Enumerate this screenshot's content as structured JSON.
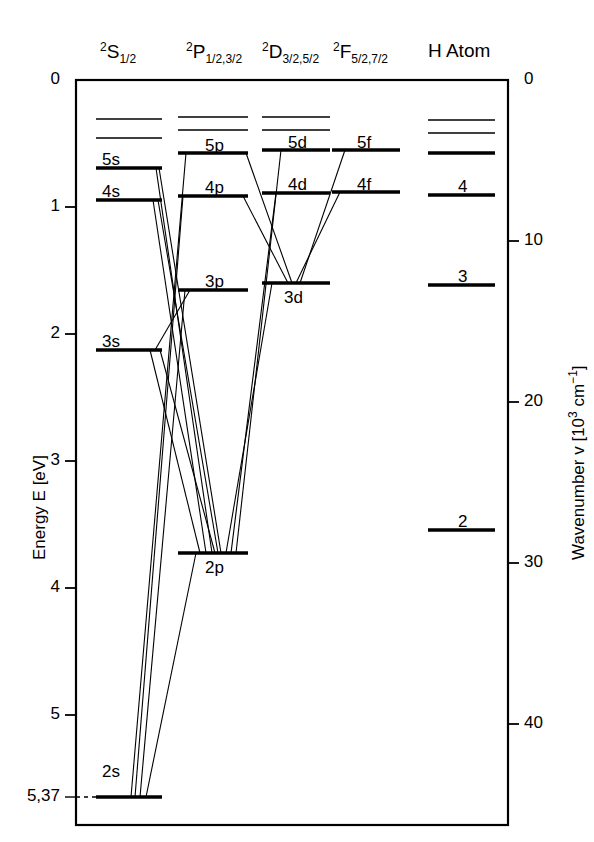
{
  "figure": {
    "kind": "grotrian-energy-level-diagram",
    "frame": {
      "x0": 76,
      "y0": 80,
      "x1": 508,
      "y1": 825
    }
  },
  "column_headers": [
    {
      "name": "header-s",
      "term": "S",
      "multiplicity": "2",
      "j": "1/2",
      "x": 100,
      "y": 40
    },
    {
      "name": "header-p",
      "term": "P",
      "multiplicity": "2",
      "j": "1/2,3/2",
      "x": 186,
      "y": 40
    },
    {
      "name": "header-d",
      "term": "D",
      "multiplicity": "2",
      "j": "3/2,5/2",
      "x": 262,
      "y": 40
    },
    {
      "name": "header-f",
      "term": "F",
      "multiplicity": "2",
      "j": "5/2,7/2",
      "x": 333,
      "y": 40
    },
    {
      "name": "header-h",
      "text": "H Atom",
      "x": 428,
      "y": 40
    }
  ],
  "left_axis": {
    "title": "Energy E [eV]",
    "title_x": 30,
    "title_y": 560,
    "unit": "eV",
    "ticks": [
      {
        "label": "0",
        "value": 0,
        "y": 80
      },
      {
        "label": "1",
        "value": 1,
        "y": 207
      },
      {
        "label": "2",
        "value": 2,
        "y": 334
      },
      {
        "label": "3",
        "value": 3,
        "y": 461
      },
      {
        "label": "4",
        "value": 4,
        "y": 588
      },
      {
        "label": "5",
        "value": 5,
        "y": 715
      },
      {
        "label": "5,37",
        "value": 5.37,
        "y": 797,
        "dashed": true
      }
    ]
  },
  "right_axis": {
    "title": "Wavenumber v [10³ cm⁻¹]",
    "title_x": 566,
    "title_y": 560,
    "unit": "10^3 cm^-1",
    "ticks": [
      {
        "label": "0",
        "value": 0,
        "y": 80
      },
      {
        "label": "10",
        "value": 10,
        "y": 241
      },
      {
        "label": "20",
        "value": 20,
        "y": 402
      },
      {
        "label": "30",
        "value": 30,
        "y": 563
      },
      {
        "label": "40",
        "value": 40,
        "y": 724
      }
    ]
  },
  "columns": [
    {
      "name": "column-s",
      "x0": 96,
      "x1": 162
    },
    {
      "name": "column-p",
      "x0": 178,
      "x1": 248
    },
    {
      "name": "column-d",
      "x0": 262,
      "x1": 330
    },
    {
      "name": "column-f",
      "x0": 332,
      "x1": 400
    },
    {
      "name": "column-h",
      "x0": 428,
      "x1": 495
    }
  ],
  "levels": [
    {
      "name": "level-s-6",
      "column": "s",
      "label": "",
      "y": 119,
      "x0": 96,
      "x1": 162,
      "thin": true
    },
    {
      "name": "level-s-5b",
      "column": "s",
      "label": "",
      "y": 138,
      "x0": 96,
      "x1": 162,
      "thin": true
    },
    {
      "name": "level-5s",
      "column": "s",
      "label": "5s",
      "y": 168,
      "x0": 96,
      "x1": 162,
      "label_x": 102,
      "label_y": 150
    },
    {
      "name": "level-4s",
      "column": "s",
      "label": "4s",
      "y": 200,
      "x0": 96,
      "x1": 162,
      "label_x": 102,
      "label_y": 182
    },
    {
      "name": "level-p-6",
      "column": "p",
      "label": "",
      "y": 117,
      "x0": 178,
      "x1": 248,
      "thin": true
    },
    {
      "name": "level-p-7",
      "column": "p",
      "label": "",
      "y": 130,
      "x0": 178,
      "x1": 248,
      "thin": true
    },
    {
      "name": "level-5p",
      "column": "p",
      "label": "5p",
      "y": 153,
      "x0": 178,
      "x1": 248,
      "label_x": 205,
      "label_y": 136
    },
    {
      "name": "level-4p",
      "column": "p",
      "label": "4p",
      "y": 196,
      "x0": 178,
      "x1": 248,
      "label_x": 205,
      "label_y": 178
    },
    {
      "name": "level-d-6",
      "column": "d",
      "label": "",
      "y": 117,
      "x0": 262,
      "x1": 330,
      "thin": true
    },
    {
      "name": "level-d-7",
      "column": "d",
      "label": "",
      "y": 130,
      "x0": 262,
      "x1": 330,
      "thin": true
    },
    {
      "name": "level-5d",
      "column": "d",
      "label": "5d",
      "y": 150,
      "x0": 262,
      "x1": 330,
      "label_x": 288,
      "label_y": 133
    },
    {
      "name": "level-4d",
      "column": "d",
      "label": "4d",
      "y": 193,
      "x0": 262,
      "x1": 330,
      "label_x": 288,
      "label_y": 175
    },
    {
      "name": "level-5f",
      "column": "f",
      "label": "5f",
      "y": 150,
      "x0": 332,
      "x1": 400,
      "label_x": 357,
      "label_y": 133
    },
    {
      "name": "level-4f",
      "column": "f",
      "label": "4f",
      "y": 192,
      "x0": 332,
      "x1": 400,
      "label_x": 357,
      "label_y": 175
    },
    {
      "name": "level-3p",
      "column": "p",
      "label": "3p",
      "y": 290,
      "x0": 178,
      "x1": 248,
      "label_x": 205,
      "label_y": 272
    },
    {
      "name": "level-3d",
      "column": "d",
      "label": "3d",
      "y": 283,
      "x0": 262,
      "x1": 330,
      "label_x": 284,
      "label_y": 288
    },
    {
      "name": "level-3s",
      "column": "s",
      "label": "3s",
      "y": 350,
      "x0": 96,
      "x1": 162,
      "label_x": 102,
      "label_y": 332
    },
    {
      "name": "level-2p",
      "column": "p",
      "label": "2p",
      "y": 553,
      "x0": 178,
      "x1": 248,
      "label_x": 205,
      "label_y": 558
    },
    {
      "name": "level-2s",
      "column": "s",
      "label": "2s",
      "y": 797,
      "x0": 96,
      "x1": 162,
      "label_x": 102,
      "label_y": 762
    },
    {
      "name": "level-h-6",
      "column": "h",
      "label": "",
      "y": 120,
      "x0": 428,
      "x1": 495,
      "thin": true
    },
    {
      "name": "level-h-5",
      "column": "h",
      "label": "",
      "y": 133,
      "x0": 428,
      "x1": 495,
      "thin": true
    },
    {
      "name": "level-h-4b",
      "column": "h",
      "label": "",
      "y": 153,
      "x0": 428,
      "x1": 495
    },
    {
      "name": "level-h-4",
      "column": "h",
      "label": "4",
      "y": 195,
      "x0": 428,
      "x1": 495,
      "label_x": 458,
      "label_y": 177
    },
    {
      "name": "level-h-3",
      "column": "h",
      "label": "3",
      "y": 285,
      "x0": 428,
      "x1": 495,
      "label_x": 458,
      "label_y": 267
    },
    {
      "name": "level-h-2",
      "column": "h",
      "label": "2",
      "y": 530,
      "x0": 428,
      "x1": 495,
      "label_x": 458,
      "label_y": 512
    }
  ],
  "transitions": [
    {
      "name": "t-5p-2s",
      "from": [
        186,
        153
      ],
      "to": [
        131,
        797
      ]
    },
    {
      "name": "t-4p-2s",
      "from": [
        183,
        196
      ],
      "to": [
        135,
        797
      ]
    },
    {
      "name": "t-3p-2s",
      "from": [
        185,
        290
      ],
      "to": [
        140,
        797
      ]
    },
    {
      "name": "t-2p-3s",
      "from": [
        200,
        553
      ],
      "to": [
        150,
        350
      ]
    },
    {
      "name": "t-2p-4s",
      "from": [
        206,
        553
      ],
      "to": [
        153,
        200
      ]
    },
    {
      "name": "t-2p-5s",
      "from": [
        212,
        553
      ],
      "to": [
        156,
        168
      ]
    },
    {
      "name": "t-2p-3d",
      "from": [
        226,
        553
      ],
      "to": [
        272,
        283
      ]
    },
    {
      "name": "t-2p-4d",
      "from": [
        231,
        553
      ],
      "to": [
        276,
        193
      ]
    },
    {
      "name": "t-2p-5d",
      "from": [
        236,
        553
      ],
      "to": [
        281,
        150
      ]
    },
    {
      "name": "t-3p-3s-a",
      "from": [
        190,
        290
      ],
      "to": [
        155,
        350
      ]
    },
    {
      "name": "t-3d-4f",
      "from": [
        296,
        283
      ],
      "to": [
        340,
        192
      ]
    },
    {
      "name": "t-3d-5f",
      "from": [
        300,
        283
      ],
      "to": [
        345,
        150
      ]
    },
    {
      "name": "t-3d-4p",
      "from": [
        288,
        283
      ],
      "to": [
        243,
        196
      ]
    },
    {
      "name": "t-3d-5p",
      "from": [
        292,
        283
      ],
      "to": [
        246,
        153
      ]
    },
    {
      "name": "t-2p-2s",
      "from": [
        196,
        553
      ],
      "to": [
        146,
        797
      ]
    },
    {
      "name": "t-3s-2p-b",
      "from": [
        160,
        350
      ],
      "to": [
        215,
        553
      ]
    },
    {
      "name": "t-4s-2p-b",
      "from": [
        158,
        200
      ],
      "to": [
        218,
        553
      ]
    },
    {
      "name": "t-5s-2p-b",
      "from": [
        159,
        168
      ],
      "to": [
        221,
        553
      ]
    }
  ]
}
